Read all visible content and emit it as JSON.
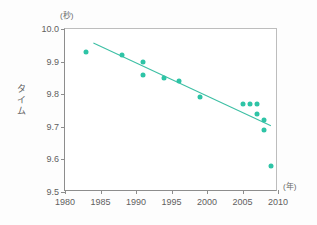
{
  "chart_data": {
    "type": "scatter",
    "title": "",
    "xlabel": "(年)",
    "ylabel": "タイム",
    "yunit": "(秒)",
    "xlim": [
      1980,
      2010
    ],
    "ylim": [
      9.5,
      10.0
    ],
    "xticks": [
      "1980",
      "1985",
      "1990",
      "1995",
      "2000",
      "2005",
      "2010"
    ],
    "xtick_values": [
      1980,
      1985,
      1990,
      1995,
      2000,
      2005,
      2010
    ],
    "yticks": [
      "9.5",
      "9.6",
      "9.7",
      "9.8",
      "9.9",
      "10.0"
    ],
    "ytick_values": [
      9.5,
      9.6,
      9.7,
      9.8,
      9.9,
      10.0
    ],
    "grid": false,
    "legend": null,
    "series": [
      {
        "name": "世界記録",
        "marker": "circle",
        "color": "#2ec4a6",
        "points": [
          {
            "x": 1983,
            "y": 9.93
          },
          {
            "x": 1988,
            "y": 9.92
          },
          {
            "x": 1991,
            "y": 9.9
          },
          {
            "x": 1991,
            "y": 9.86
          },
          {
            "x": 1994,
            "y": 9.85
          },
          {
            "x": 1996,
            "y": 9.84
          },
          {
            "x": 1999,
            "y": 9.79
          },
          {
            "x": 2005,
            "y": 9.77
          },
          {
            "x": 2006,
            "y": 9.77
          },
          {
            "x": 2007,
            "y": 9.77
          },
          {
            "x": 2007,
            "y": 9.74
          },
          {
            "x": 2008,
            "y": 9.72
          },
          {
            "x": 2008,
            "y": 9.69
          },
          {
            "x": 2009,
            "y": 9.58
          }
        ]
      }
    ],
    "trendline": {
      "name": "回帰直線",
      "color": "#3dbfa4",
      "x_start": 1984,
      "y_start": 9.957,
      "x_end": 2009,
      "y_end": 9.703
    }
  },
  "axes": {
    "y_unit_caption": "(秒)",
    "x_unit_caption": "(年)",
    "y_title_chars": [
      "タ",
      "イ",
      "ム"
    ]
  },
  "colors": {
    "marker": "#2ec4a6",
    "trend": "#3dbfa4",
    "axis": "#8d8d8d",
    "tick_text": "#5f5f5f",
    "background": "#ffffff"
  }
}
